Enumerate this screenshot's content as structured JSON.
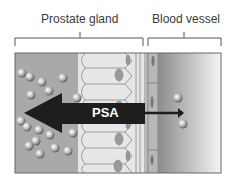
{
  "labels": {
    "prostate": "Prostate gland",
    "vessel": "Blood vessel",
    "psa": "PSA"
  },
  "colors": {
    "lumen": "#a9a9a9",
    "cells": "#e8e8e8",
    "nucleus": "#9a9a9a",
    "vessel_dark": "#8c8c8c",
    "vessel_light": "#f2f2f2",
    "arrow": "#1e1e1e",
    "bracket": "#555555"
  }
}
